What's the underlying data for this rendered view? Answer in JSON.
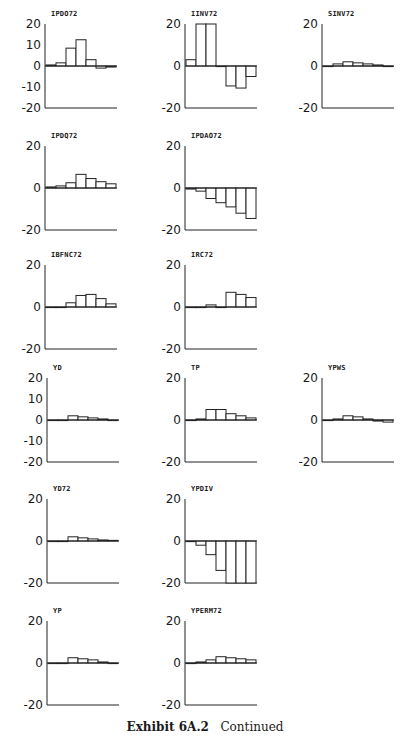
{
  "caption": {
    "label": "Exhibit 6A.2",
    "text": "Continued"
  },
  "y_ticks_full": [
    "20",
    "10",
    "0",
    "-10",
    "-20"
  ],
  "y_ticks_short": [
    "20",
    "0",
    "-20"
  ],
  "chart_data": [
    {
      "type": "bar",
      "title": "IPDO72",
      "ylim": [
        -20,
        20
      ],
      "yticks": [
        20,
        10,
        0,
        -10,
        -20
      ],
      "values": [
        0.5,
        1.5,
        8.5,
        12.5,
        3,
        -1,
        -0.5
      ],
      "grid": false,
      "legend": null
    },
    {
      "type": "bar",
      "title": "IINV72",
      "ylim": [
        -20,
        20
      ],
      "yticks": [
        20,
        0,
        -20
      ],
      "values": [
        3,
        20,
        20,
        0,
        -9.5,
        -10.5,
        -5
      ],
      "grid": false,
      "legend": null
    },
    {
      "type": "bar",
      "title": "SINV72",
      "ylim": [
        -20,
        20
      ],
      "yticks": [
        20,
        0,
        -20
      ],
      "values": [
        0,
        1,
        2,
        1.5,
        1,
        0.5,
        0
      ],
      "grid": false,
      "legend": null
    },
    {
      "type": "bar",
      "title": "IPDQ72",
      "ylim": [
        -20,
        20
      ],
      "yticks": [
        20,
        0,
        -20
      ],
      "values": [
        0.5,
        1,
        2.5,
        6.5,
        4.5,
        3,
        2
      ],
      "grid": false,
      "legend": null
    },
    {
      "type": "bar",
      "title": "IPDAO72",
      "ylim": [
        -20,
        20
      ],
      "yticks": [
        20,
        0,
        -20
      ],
      "values": [
        -0.5,
        -1.5,
        -5,
        -7,
        -9,
        -12,
        -14.5
      ],
      "grid": false,
      "legend": null
    },
    {
      "type": "bar",
      "title": "IBFNC72",
      "ylim": [
        -20,
        20
      ],
      "yticks": [
        20,
        0,
        -20
      ],
      "values": [
        -0.2,
        0,
        2,
        5.5,
        6,
        4,
        1.5
      ],
      "grid": false,
      "legend": null
    },
    {
      "type": "bar",
      "title": "IRC72",
      "ylim": [
        -20,
        20
      ],
      "yticks": [
        20,
        0,
        -20
      ],
      "values": [
        0,
        0,
        1,
        0,
        7,
        6,
        4.5
      ],
      "grid": false,
      "legend": null
    },
    {
      "type": "bar",
      "title": "YD",
      "ylim": [
        -20,
        20
      ],
      "yticks": [
        20,
        10,
        0,
        -10,
        -20
      ],
      "values": [
        0,
        0,
        2,
        1.5,
        1,
        0.5,
        0
      ],
      "grid": false,
      "legend": null
    },
    {
      "type": "bar",
      "title": "TP",
      "ylim": [
        -20,
        20
      ],
      "yticks": [
        20,
        0,
        -20
      ],
      "values": [
        0,
        0.5,
        5,
        5,
        3,
        2,
        1
      ],
      "grid": false,
      "legend": null
    },
    {
      "type": "bar",
      "title": "YPWS",
      "ylim": [
        -20,
        20
      ],
      "yticks": [
        20,
        0,
        -20
      ],
      "values": [
        0,
        0.5,
        2,
        1.5,
        0.5,
        -0.5,
        -1
      ],
      "grid": false,
      "legend": null
    },
    {
      "type": "bar",
      "title": "YD72",
      "ylim": [
        -20,
        20
      ],
      "yticks": [
        20,
        0,
        -20
      ],
      "values": [
        0,
        0,
        2,
        1.5,
        1,
        0.5,
        0.3
      ],
      "grid": false,
      "legend": null
    },
    {
      "type": "bar",
      "title": "YPDIV",
      "ylim": [
        -20,
        20
      ],
      "yticks": [
        20,
        0,
        -20
      ],
      "values": [
        -0.3,
        -2,
        -6.5,
        -14,
        -20,
        -20,
        -20
      ],
      "grid": false,
      "legend": null
    },
    {
      "type": "bar",
      "title": "YP",
      "ylim": [
        -20,
        20
      ],
      "yticks": [
        20,
        0,
        -20
      ],
      "values": [
        0,
        0,
        2.5,
        2,
        1.5,
        0.5,
        0
      ],
      "grid": false,
      "legend": null
    },
    {
      "type": "bar",
      "title": "YPERM72",
      "ylim": [
        -20,
        20
      ],
      "yticks": [
        20,
        0,
        -20
      ],
      "values": [
        0,
        0.5,
        1.5,
        3,
        2.5,
        2,
        1.5
      ],
      "grid": false,
      "legend": null
    }
  ],
  "panels": [
    {
      "title": "IPDO72",
      "left": 15,
      "top": 14,
      "ticks": "full"
    },
    {
      "title": "IINV72",
      "left": 155,
      "top": 14,
      "ticks": "short"
    },
    {
      "title": "SINV72",
      "left": 292,
      "top": 14,
      "ticks": "short"
    },
    {
      "title": "IPDQ72",
      "left": 15,
      "top": 136,
      "ticks": "short"
    },
    {
      "title": "IPDAO72",
      "left": 155,
      "top": 136,
      "ticks": "short"
    },
    {
      "title": "IBFNC72",
      "left": 15,
      "top": 255,
      "ticks": "short"
    },
    {
      "title": "IRC72",
      "left": 155,
      "top": 255,
      "ticks": "short"
    },
    {
      "title": "YD",
      "left": 17,
      "top": 368,
      "ticks": "full"
    },
    {
      "title": "TP",
      "left": 155,
      "top": 368,
      "ticks": "short"
    },
    {
      "title": "YPWS",
      "left": 292,
      "top": 368,
      "ticks": "short"
    },
    {
      "title": "YD72",
      "left": 17,
      "top": 489,
      "ticks": "short"
    },
    {
      "title": "YPDIV",
      "left": 155,
      "top": 489,
      "ticks": "short"
    },
    {
      "title": "YP",
      "left": 17,
      "top": 611,
      "ticks": "short"
    },
    {
      "title": "YPERM72",
      "left": 155,
      "top": 611,
      "ticks": "short"
    }
  ]
}
